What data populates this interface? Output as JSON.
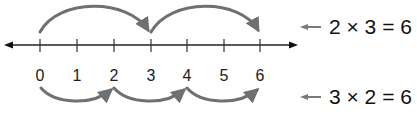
{
  "number_line": {
    "min": 0,
    "max": 6,
    "tick_labels": [
      "0",
      "1",
      "2",
      "3",
      "4",
      "5",
      "6"
    ],
    "line_color": "#222222",
    "arc_color": "#707070"
  },
  "top_jumps": {
    "jump_size": 3,
    "count": 2,
    "path": [
      0,
      3,
      6
    ],
    "equation": "2 × 3 = 6"
  },
  "bottom_jumps": {
    "jump_size": 2,
    "count": 3,
    "path": [
      0,
      2,
      4,
      6
    ],
    "equation": "3 × 2 = 6"
  }
}
